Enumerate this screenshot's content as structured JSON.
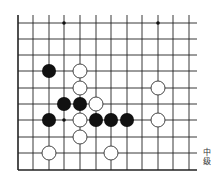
{
  "diagram": {
    "type": "go-board-fragment",
    "grid": {
      "x_lines": [
        18,
        33,
        49,
        64,
        80,
        96,
        111,
        127,
        142,
        158,
        173,
        189
      ],
      "y_lines": [
        23,
        39,
        55,
        71,
        88,
        104,
        120,
        137,
        153,
        170
      ],
      "line_color": "#222222",
      "left_edge": true,
      "bottom_edge": true
    },
    "stone_radius": 7,
    "black_stones": [
      {
        "col": 2,
        "row": 3
      },
      {
        "col": 3,
        "row": 5
      },
      {
        "col": 4,
        "row": 5
      },
      {
        "col": 2,
        "row": 6
      },
      {
        "col": 5,
        "row": 6
      },
      {
        "col": 6,
        "row": 6
      },
      {
        "col": 7,
        "row": 6
      }
    ],
    "white_stones": [
      {
        "col": 4,
        "row": 3
      },
      {
        "col": 4,
        "row": 4
      },
      {
        "col": 9,
        "row": 4
      },
      {
        "col": 5,
        "row": 5
      },
      {
        "col": 4,
        "row": 6
      },
      {
        "col": 9,
        "row": 6
      },
      {
        "col": 4,
        "row": 7
      },
      {
        "col": 2,
        "row": 8
      },
      {
        "col": 6,
        "row": 8
      }
    ],
    "star_points": [
      {
        "col": 3,
        "row": 0
      },
      {
        "col": 9,
        "row": 0
      },
      {
        "col": 3,
        "row": 6
      }
    ],
    "colors": {
      "black_stone": "#111111",
      "white_stone_fill": "#ffffff",
      "white_stone_stroke": "#333333"
    }
  },
  "caption": {
    "line1": "中",
    "line2": "级"
  }
}
